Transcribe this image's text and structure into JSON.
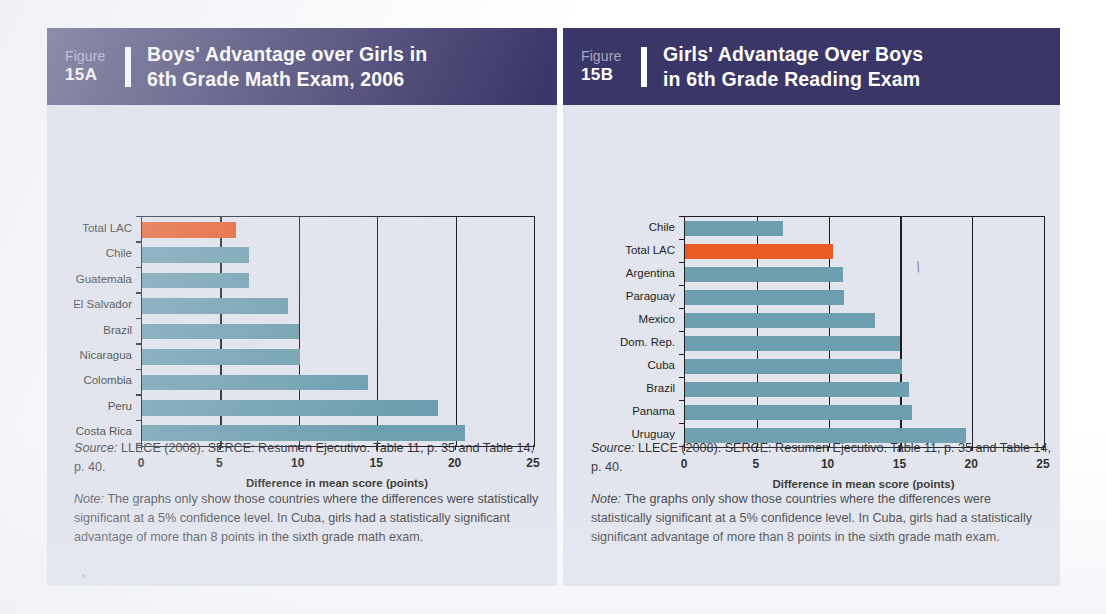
{
  "colors": {
    "header_bg": "#3b3668",
    "panel_bg": "#e2e5ed",
    "bar_default": "#6e9fb0",
    "bar_highlight": "#ea5a24",
    "axis": "#1d1d22"
  },
  "panels": [
    {
      "figure_word": "Figure",
      "figure_id": "15A",
      "title_line1": "Boys' Advantage over Girls in",
      "title_line2": "6th Grade Math Exam, 2006",
      "notes": [
        {
          "lead": "Source:",
          "text": " LLECE (2008). SERCE: Resumen Ejecutivo. Table 11, p. 35 and Table 14, p. 40."
        },
        {
          "lead": "Note:",
          "text": " The graphs only show those countries where the differences were statistically significant at a 5% confidence level. In Cuba, girls had a statistically significant advantage of more than 8 points in the sixth grade math exam."
        }
      ],
      "chart_data": {
        "type": "bar",
        "orientation": "horizontal",
        "title": "Boys' Advantage over Girls in 6th Grade Math Exam, 2006",
        "xlabel": "Difference in mean score (points)",
        "ylabel": "",
        "xlim": [
          0,
          25
        ],
        "xticks": [
          0,
          5,
          10,
          15,
          20,
          25
        ],
        "grid": true,
        "grid_axis": "x",
        "legend": null,
        "categories": [
          "Total LAC",
          "Chile",
          "Guatemala",
          "El Salvador",
          "Brazil",
          "Nicaragua",
          "Colombia",
          "Peru",
          "Costa Rica"
        ],
        "values": [
          6.0,
          6.8,
          6.8,
          9.3,
          10.0,
          10.1,
          14.4,
          18.9,
          20.6
        ],
        "highlight_categories": [
          "Total LAC"
        ]
      }
    },
    {
      "figure_word": "Figure",
      "figure_id": "15B",
      "title_line1": "Girls' Advantage Over Boys",
      "title_line2": "in 6th Grade Reading Exam",
      "notes": [
        {
          "lead": "Source:",
          "text": " LLECE (2008). SERCE: Resumen Ejecutivo. Table 11, p. 35 and Table 14, p. 40."
        },
        {
          "lead": "Note:",
          "text": " The graphs only show those countries where the differences were statistically significant at a 5% confidence level. In Cuba, girls had a statistically significant advantage of more than 8 points in the sixth grade math exam."
        }
      ],
      "chart_data": {
        "type": "bar",
        "orientation": "horizontal",
        "title": "Girls' Advantage Over Boys in 6th Grade Reading Exam",
        "xlabel": "Difference in mean score (points)",
        "ylabel": "",
        "xlim": [
          0,
          25
        ],
        "xticks": [
          0,
          5,
          10,
          15,
          20,
          25
        ],
        "grid": true,
        "grid_axis": "x",
        "legend": null,
        "categories": [
          "Chile",
          "Total LAC",
          "Argentina",
          "Paraguay",
          "Mexico",
          "Dom. Rep.",
          "Cuba",
          "Brazil",
          "Panama",
          "Uruguay"
        ],
        "values": [
          6.8,
          10.3,
          11.0,
          11.1,
          13.2,
          15.0,
          15.1,
          15.6,
          15.8,
          19.6
        ],
        "highlight_categories": [
          "Total LAC"
        ]
      }
    }
  ]
}
